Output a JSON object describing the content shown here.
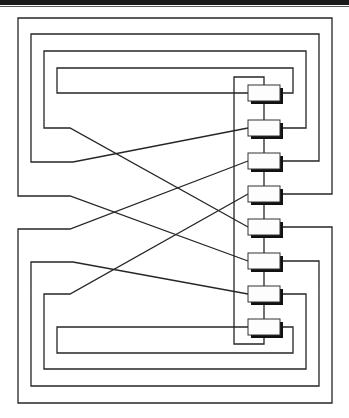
{
  "diagram": {
    "type": "wiring-diagram",
    "colors": {
      "line": "#262626",
      "box_fill": "#fdfdfd",
      "shadow": "#111111",
      "background": "#ffffff"
    },
    "node_count": 8,
    "nodes": [
      {
        "id": "node-1",
        "cy": 93
      },
      {
        "id": "node-2",
        "cy": 128
      },
      {
        "id": "node-3",
        "cy": 161
      },
      {
        "id": "node-4",
        "cy": 194
      },
      {
        "id": "node-5",
        "cy": 227
      },
      {
        "id": "node-6",
        "cy": 261
      },
      {
        "id": "node-7",
        "cy": 294
      },
      {
        "id": "node-8",
        "cy": 327
      }
    ],
    "connections": [
      {
        "from": "node-1",
        "to": "node-8",
        "route": "loop-4"
      },
      {
        "from": "node-2",
        "to": "node-7",
        "route": "loop-3-crossed"
      },
      {
        "from": "node-3",
        "to": "node-6",
        "route": "loop-2-crossed"
      },
      {
        "from": "node-4",
        "to": "node-5",
        "route": "loop-1-crossed"
      }
    ],
    "text": []
  }
}
